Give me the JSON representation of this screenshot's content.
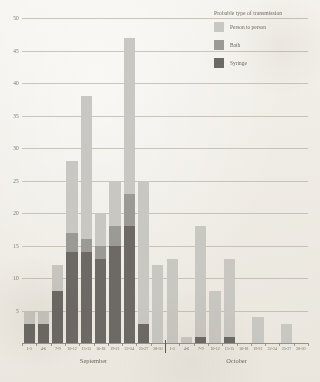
{
  "legend": {
    "title": "Probable type of transmission",
    "items": [
      {
        "label": "Person to person",
        "color": "#c9c7c1",
        "key": "person"
      },
      {
        "label": "Bath",
        "color": "#9c9a95",
        "key": "bath"
      },
      {
        "label": "Syringe",
        "color": "#6d6a66",
        "key": "syringe"
      }
    ]
  },
  "chart_data": {
    "type": "bar",
    "title": "",
    "subtitle": "",
    "xlabel": "",
    "ylabel": "",
    "stacked": true,
    "grid": true,
    "legend_position": "top-right",
    "ylim": [
      0,
      50
    ],
    "yticks": [
      0,
      5,
      10,
      15,
      20,
      25,
      30,
      35,
      40,
      45,
      50
    ],
    "ytick_labels": [
      "0",
      "5",
      "10",
      "15",
      "20",
      "25",
      "30",
      "35",
      "40",
      "45",
      "50"
    ],
    "categories": [
      "1-3",
      "4-6",
      "7-9",
      "10-12",
      "13-15",
      "16-18",
      "19-21",
      "22-24",
      "25-27",
      "28-30",
      "1-3",
      "4-6",
      "7-9",
      "10-12",
      "13-15",
      "16-18",
      "19-21",
      "22-24",
      "25-27",
      "28-30"
    ],
    "group_labels": [
      {
        "name": "September",
        "start": 0,
        "end": 9
      },
      {
        "name": "October",
        "start": 10,
        "end": 19
      }
    ],
    "series": [
      {
        "name": "Syringe",
        "color": "#6d6a66",
        "values": [
          3,
          3,
          8,
          14,
          14,
          13,
          15,
          18,
          3,
          0,
          0,
          0,
          1,
          0,
          1,
          0,
          0,
          0,
          0,
          0
        ]
      },
      {
        "name": "Bath",
        "color": "#9c9a95",
        "values": [
          0,
          0,
          0,
          3,
          2,
          2,
          3,
          5,
          0,
          0,
          0,
          0,
          0,
          0,
          0,
          0,
          0,
          0,
          0,
          0
        ]
      },
      {
        "name": "Person to person",
        "color": "#c9c7c1",
        "values": [
          2,
          2,
          4,
          11,
          22,
          5,
          7,
          24,
          22,
          12,
          13,
          1,
          17,
          8,
          12,
          0,
          4,
          0,
          3,
          0
        ]
      }
    ],
    "totals": [
      5,
      5,
      12,
      28,
      38,
      20,
      25,
      47,
      25,
      12,
      13,
      1,
      18,
      8,
      13,
      0,
      4,
      0,
      3,
      0
    ]
  }
}
